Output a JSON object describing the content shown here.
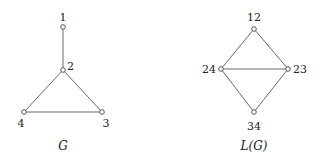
{
  "graphs": [
    {
      "caption": "G",
      "nodes": [
        {
          "id": "1",
          "label": "1"
        },
        {
          "id": "2",
          "label": "2"
        },
        {
          "id": "3",
          "label": "3"
        },
        {
          "id": "4",
          "label": "4"
        }
      ],
      "edges": [
        [
          "1",
          "2"
        ],
        [
          "2",
          "4"
        ],
        [
          "2",
          "3"
        ],
        [
          "4",
          "3"
        ]
      ]
    },
    {
      "caption": "L(G)",
      "nodes": [
        {
          "id": "12",
          "label": "12"
        },
        {
          "id": "24",
          "label": "24"
        },
        {
          "id": "23",
          "label": "23"
        },
        {
          "id": "34",
          "label": "34"
        }
      ],
      "edges": [
        [
          "12",
          "24"
        ],
        [
          "12",
          "23"
        ],
        [
          "24",
          "23"
        ],
        [
          "24",
          "34"
        ],
        [
          "23",
          "34"
        ]
      ]
    }
  ]
}
